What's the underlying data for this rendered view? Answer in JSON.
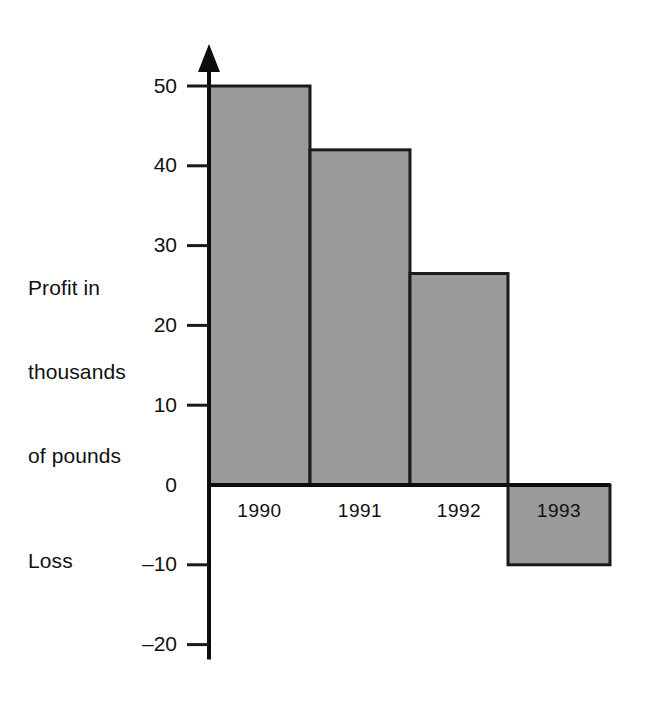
{
  "chart_data": {
    "type": "bar",
    "title": "",
    "subtitle": "",
    "xlabel": "",
    "ylabel": "Profit in thousands of pounds",
    "secondary_axis_label": "Loss",
    "categories": [
      "1990",
      "1991",
      "1992",
      "1993"
    ],
    "values": [
      50,
      42,
      26.5,
      -10
    ],
    "series": [
      {
        "name": "Profit",
        "values": [
          50,
          42,
          26.5,
          -10
        ]
      }
    ],
    "ylim": [
      -20,
      50
    ],
    "ytick_values": [
      50,
      40,
      30,
      20,
      10,
      0,
      -10,
      -20
    ],
    "ytick_labels": [
      "50",
      "40",
      "30",
      "20",
      "10",
      "0",
      "–10",
      "–20"
    ],
    "grid": false,
    "legend": false,
    "legend_position": "none",
    "bar_fill_color": "#9a9a9a",
    "bar_stroke_color": "#1a1a1a",
    "axis_color": "#0d0d0d",
    "background_color": "#ffffff",
    "axis_arrow": true
  },
  "axis_caption": {
    "line1": "Profit in",
    "line2": "thousands",
    "line3": "of pounds"
  },
  "loss_caption": {
    "text": "Loss"
  },
  "y_ticks": [
    {
      "label": "50",
      "value": 50
    },
    {
      "label": "40",
      "value": 40
    },
    {
      "label": "30",
      "value": 30
    },
    {
      "label": "20",
      "value": 20
    },
    {
      "label": "10",
      "value": 10
    },
    {
      "label": "0",
      "value": 0
    },
    {
      "label": "–10",
      "value": -10
    },
    {
      "label": "–20",
      "value": -20
    }
  ],
  "bars": [
    {
      "label": "1990",
      "value": 50
    },
    {
      "label": "1991",
      "value": 42
    },
    {
      "label": "1992",
      "value": 26.5
    },
    {
      "label": "1993",
      "value": -10
    }
  ]
}
